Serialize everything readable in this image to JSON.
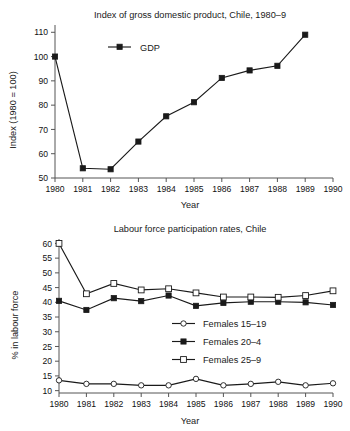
{
  "chart_data": [
    {
      "id": "gdp",
      "type": "line",
      "title": "Index of gross domestic product, Chile, 1980–9",
      "xlabel": "Year",
      "ylabel": "Index (1980 = 100)",
      "x": [
        1980,
        1981,
        1982,
        1983,
        1984,
        1985,
        1986,
        1987,
        1988,
        1989
      ],
      "xticks": [
        "1980",
        "1981",
        "1982",
        "1983",
        "1984",
        "1985",
        "1986",
        "1987",
        "1988",
        "1989",
        "1990"
      ],
      "xlim": [
        1980,
        1990
      ],
      "yticks": [
        "50",
        "60",
        "70",
        "80",
        "90",
        "100",
        "110"
      ],
      "ylim": [
        50,
        113
      ],
      "grid": false,
      "legend_position": "upper-center",
      "series": [
        {
          "name": "GDP",
          "marker": "filled-square",
          "values": [
            100,
            54,
            53.6,
            65,
            75.4,
            81.2,
            91.2,
            94.3,
            96.2,
            109
          ]
        }
      ]
    },
    {
      "id": "lfp",
      "type": "line",
      "title": "Labour force participation rates, Chile",
      "xlabel": "Year",
      "ylabel": "% in labour force",
      "x": [
        1980,
        1981,
        1982,
        1983,
        1984,
        1985,
        1986,
        1987,
        1988,
        1989,
        1990
      ],
      "xticks": [
        "1980",
        "1981",
        "1982",
        "1983",
        "1984",
        "1985",
        "1986",
        "1987",
        "1988",
        "1989",
        "1990"
      ],
      "xlim": [
        1980,
        1990
      ],
      "yticks": [
        "10",
        "15",
        "20",
        "25",
        "30",
        "35",
        "40",
        "45",
        "50",
        "55",
        "60"
      ],
      "ylim": [
        9.2,
        61.5
      ],
      "grid": false,
      "legend_position": "center-right",
      "series": [
        {
          "name": "Females 15–19",
          "marker": "open-circle",
          "values": [
            13.5,
            12.3,
            12.3,
            11.8,
            11.8,
            14.0,
            11.8,
            12.3,
            13.0,
            11.8,
            12.5
          ]
        },
        {
          "name": "Females 20–4",
          "marker": "filled-square",
          "values": [
            40.5,
            37.4,
            41.4,
            40.4,
            42.3,
            38.8,
            39.8,
            40.2,
            40.2,
            40.0,
            39.1
          ]
        },
        {
          "name": "Females 25–9",
          "marker": "open-square",
          "values": [
            60.0,
            42.9,
            46.4,
            44.2,
            44.6,
            43.2,
            41.8,
            41.8,
            41.7,
            42.3,
            43.9
          ]
        }
      ]
    }
  ],
  "gdp": {
    "title": "Index of gross domestic product, Chile, 1980–9",
    "xlabel": "Year",
    "ylabel": "Index (1980 = 100)",
    "legend": {
      "gdp_label": "GDP"
    },
    "yticks": [
      "110",
      "100",
      "90",
      "80",
      "70",
      "60",
      "50"
    ],
    "xticks": [
      "1980",
      "1981",
      "1982",
      "1983",
      "1984",
      "1985",
      "1986",
      "1987",
      "1988",
      "1989",
      "1990"
    ]
  },
  "lfp": {
    "title": "Labour force participation rates, Chile",
    "xlabel": "Year",
    "ylabel": "% in labour force",
    "legend": {
      "series1_label": "Females 15–19",
      "series2_label": "Females 20–4",
      "series3_label": "Females 25–9"
    },
    "yticks": [
      "60",
      "55",
      "50",
      "45",
      "40",
      "35",
      "30",
      "25",
      "20",
      "15",
      "10"
    ],
    "xticks": [
      "1980",
      "1981",
      "1982",
      "1983",
      "1984",
      "1985",
      "1986",
      "1987",
      "1988",
      "1989",
      "1990"
    ]
  },
  "colors": {
    "ink": "#1a1a1a",
    "axis": "#555555",
    "background": "#ffffff"
  }
}
